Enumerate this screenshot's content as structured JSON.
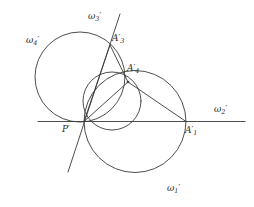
{
  "figure": {
    "width": 254,
    "height": 207,
    "background_color": "#ffffff",
    "stroke_color": "#3a3a3a"
  },
  "labels": {
    "omega1": {
      "text": "ω",
      "sub": "1",
      "prime": "′",
      "x": 167,
      "y": 183
    },
    "omega2": {
      "text": "ω",
      "sub": "2",
      "prime": "′",
      "x": 214,
      "y": 104
    },
    "omega3": {
      "text": "ω",
      "sub": "3",
      "prime": "′",
      "x": 88,
      "y": 11
    },
    "omega4": {
      "text": "ω",
      "sub": "4",
      "prime": "′",
      "x": 26,
      "y": 35
    },
    "A1": {
      "text": "A",
      "sub": "1",
      "prime": "′",
      "x": 185,
      "y": 125
    },
    "A3": {
      "text": "A",
      "sub": "3",
      "prime": "′",
      "x": 112,
      "y": 33
    },
    "A4": {
      "text": "A",
      "sub": "4",
      "prime": "′",
      "x": 127,
      "y": 63
    },
    "P": {
      "text": "P",
      "sub": "",
      "prime": "′",
      "x": 62,
      "y": 124
    }
  },
  "geometry": {
    "circles": [
      {
        "name": "omega1-circle",
        "cx": 135,
        "cy": 121.5,
        "r": 51
      },
      {
        "name": "omega4-circle",
        "cx": 80,
        "cy": 77,
        "r": 45
      },
      {
        "name": "small-circle",
        "cx": 112,
        "cy": 101,
        "r": 29
      }
    ],
    "lines": [
      {
        "name": "omega2-radical-axis",
        "x1": 38,
        "y1": 121.5,
        "x2": 245,
        "y2": 121.5
      },
      {
        "name": "omega3-line",
        "x1": 120,
        "y1": 14,
        "x2": 68,
        "y2": 172
      },
      {
        "name": "chord-P-A3",
        "x1": 84,
        "y1": 121.5,
        "x2": 110,
        "y2": 45
      },
      {
        "name": "chord-P-A4",
        "x1": 84,
        "y1": 121.5,
        "x2": 128,
        "y2": 82
      },
      {
        "name": "chord-A3-A4",
        "x1": 110,
        "y1": 45,
        "x2": 128,
        "y2": 82
      },
      {
        "name": "chord-A4-A1",
        "x1": 128,
        "y1": 82,
        "x2": 186,
        "y2": 121.5
      }
    ],
    "points": [
      {
        "name": "point-P",
        "x": 84,
        "y": 121.5
      },
      {
        "name": "point-A1",
        "x": 186,
        "y": 121.5
      },
      {
        "name": "point-A3",
        "x": 110,
        "y": 45
      },
      {
        "name": "point-A4",
        "x": 128,
        "y": 82
      }
    ]
  }
}
